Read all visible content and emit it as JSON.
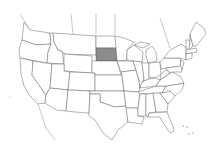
{
  "map": {
    "type": "choropleth",
    "region": "United States (contiguous) with Canada/Mexico borders",
    "highlighted_state": "South Dakota",
    "highlight_color": "#8c8c8c",
    "default_fill": "#ffffff",
    "stroke_color": "#555555",
    "background": "#ffffff"
  }
}
